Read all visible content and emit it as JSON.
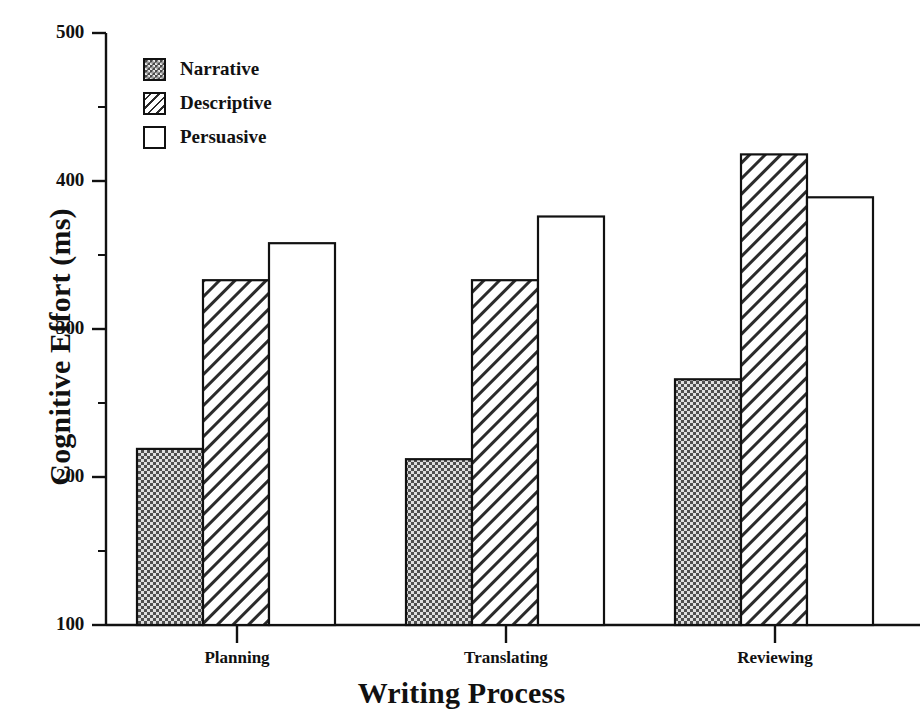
{
  "chart_data": {
    "type": "bar",
    "title": "",
    "xlabel": "Writing Process",
    "ylabel": "Cognitive Effort (ms)",
    "categories": [
      "Planning",
      "Translating",
      "Reviewing"
    ],
    "series": [
      {
        "name": "Narrative",
        "values": [
          219,
          212,
          266
        ]
      },
      {
        "name": "Descriptive",
        "values": [
          333,
          333,
          418
        ]
      },
      {
        "name": "Persuasive",
        "values": [
          358,
          376,
          389
        ]
      }
    ],
    "ylim": [
      100,
      500
    ],
    "ytick_labels": [
      "500",
      "400",
      "300",
      "200",
      "100"
    ],
    "ytick_values": [
      500,
      400,
      300,
      200,
      100
    ],
    "yminor_values": [
      450,
      350,
      250,
      150
    ],
    "grid": false,
    "legend_position": "upper-left-inside",
    "style": {
      "axis_color": "#111111",
      "bar_edge_color": "#111111",
      "narrative_fill": "#4a4a4a",
      "descriptive_fill": "#ffffff",
      "persuasive_fill": "#ffffff",
      "background": "#ffffff"
    }
  },
  "legend": {
    "items": [
      {
        "label": "Narrative",
        "swatch": "checkerboard-dark-swatch"
      },
      {
        "label": "Descriptive",
        "swatch": "diagonal-hatch-swatch"
      },
      {
        "label": "Persuasive",
        "swatch": "empty-white-swatch"
      }
    ]
  },
  "axes": {
    "y_label": "Cognitive Effort (ms)",
    "x_label": "Writing Process",
    "y_ticks": [
      "500",
      "400",
      "300",
      "200",
      "100"
    ],
    "x_ticks": [
      "Planning",
      "Translating",
      "Reviewing"
    ]
  }
}
